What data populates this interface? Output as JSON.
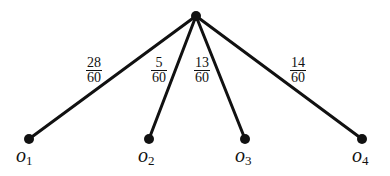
{
  "diagram": {
    "type": "probability-tree",
    "root": {
      "x": 196,
      "y": 16
    },
    "branches": [
      {
        "id": "o1",
        "num": "28",
        "den": "60",
        "leaf": {
          "x": 29,
          "y": 139
        },
        "label": "o",
        "sub": "1",
        "frac_pos": {
          "x": 86,
          "y": 56
        },
        "label_pos": {
          "x": 16,
          "y": 144
        }
      },
      {
        "id": "o2",
        "num": "5",
        "den": "60",
        "leaf": {
          "x": 149,
          "y": 139
        },
        "label": "o",
        "sub": "2",
        "frac_pos": {
          "x": 151,
          "y": 56
        },
        "label_pos": {
          "x": 138,
          "y": 144
        }
      },
      {
        "id": "o3",
        "num": "13",
        "den": "60",
        "leaf": {
          "x": 245,
          "y": 139
        },
        "label": "o",
        "sub": "3",
        "frac_pos": {
          "x": 194,
          "y": 56
        },
        "label_pos": {
          "x": 235,
          "y": 144
        }
      },
      {
        "id": "o4",
        "num": "14",
        "den": "60",
        "leaf": {
          "x": 362,
          "y": 139
        },
        "label": "o",
        "sub": "4",
        "frac_pos": {
          "x": 290,
          "y": 56
        },
        "label_pos": {
          "x": 352,
          "y": 144
        }
      }
    ]
  }
}
